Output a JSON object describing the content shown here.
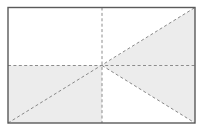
{
  "document": {
    "title": "Rectangle Diagonal Partition Diagram",
    "type": "geometric-diagram",
    "canvas": {
      "width": 204,
      "height": 132,
      "background": "#ffffff"
    }
  },
  "colors": {
    "background": "#ffffff",
    "shaded_fill": "#ececec",
    "unshaded_fill": "#ffffff",
    "border_stroke": "#5a5a5a",
    "dashed_stroke": "#8c8c8c",
    "diagonal_stroke": "#888888"
  },
  "geometry": {
    "rectangle": {
      "left": 8,
      "top": 7.5,
      "right": 195,
      "bottom": 123,
      "width": 187,
      "height": 115.5,
      "stroke_width": 1.4
    },
    "center_point": {
      "x": 102,
      "y": 65.5
    },
    "midlines": {
      "vertical_x": 102,
      "horizontal_y": 65.5
    },
    "dash_pattern": "3 2.4",
    "stroke_width_dashed": 1
  },
  "regions": [
    {
      "name": "top-left-quadrant",
      "fill": "unshaded",
      "points": "8,7.5 102,7.5 102,65.5 8,65.5"
    },
    {
      "name": "top-right-upper-triangle",
      "fill": "unshaded",
      "points": "102,7.5 195,7.5 102,65.5"
    },
    {
      "name": "top-right-lower-triangle",
      "fill": "shaded",
      "points": "195,7.5 195,65.5 102,65.5"
    },
    {
      "name": "bottom-left-quadrant",
      "fill": "shaded",
      "points": "8,65.5 102,65.5 102,123 8,123"
    },
    {
      "name": "bottom-right-upper-triangle",
      "fill": "shaded",
      "points": "102,65.5 195,65.5 195,123"
    },
    {
      "name": "bottom-right-lower-triangle",
      "fill": "unshaded",
      "points": "102,65.5 195,123 102,123"
    }
  ],
  "lines": [
    {
      "name": "vertical-midline",
      "style": "dashed",
      "x1": 102,
      "y1": 7.5,
      "x2": 102,
      "y2": 123
    },
    {
      "name": "horizontal-midline",
      "style": "dashed",
      "x1": 8,
      "y1": 65.5,
      "x2": 195,
      "y2": 65.5
    },
    {
      "name": "main-diagonal-bottomleft-to-topright",
      "style": "dashed",
      "x1": 8,
      "y1": 123,
      "x2": 195,
      "y2": 7.5
    },
    {
      "name": "diagonal-center-to-bottomright",
      "style": "dashed",
      "x1": 102,
      "y1": 65.5,
      "x2": 195,
      "y2": 123
    }
  ],
  "labels": {
    "has_text": false,
    "annotations": []
  }
}
